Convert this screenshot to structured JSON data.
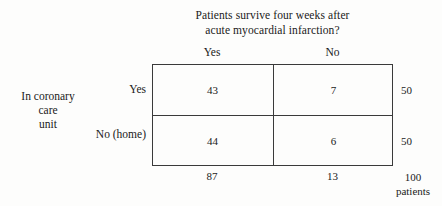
{
  "chart_data": {
    "type": "table",
    "title": "Patients survive four weeks after acute myocardial infarction?",
    "column_group_label_lines": [
      "Patients survive four weeks after",
      "acute myocardial infarction?"
    ],
    "row_group_label_lines": [
      "In coronary",
      "care",
      "unit"
    ],
    "row_group_label": "In coronary care unit",
    "columns": [
      "Yes",
      "No"
    ],
    "rows": [
      "Yes",
      "No (home)"
    ],
    "values": [
      [
        43,
        7
      ],
      [
        44,
        6
      ]
    ],
    "row_totals": [
      50,
      50
    ],
    "column_totals": [
      87,
      13
    ],
    "grand_total": 100,
    "grand_total_unit": "patients",
    "cells": [
      {
        "row": "Yes",
        "column": "Yes",
        "value": "43"
      },
      {
        "row": "Yes",
        "column": "No",
        "value": "7"
      },
      {
        "row": "No (home)",
        "column": "Yes",
        "value": "44"
      },
      {
        "row": "No (home)",
        "column": "No",
        "value": "6"
      }
    ],
    "row_total_labels": [
      "50",
      "50"
    ],
    "column_total_labels": [
      "87",
      "13"
    ],
    "grand_total_label": "100",
    "colors": {
      "background": "#fdfdfc",
      "rule": "#3a3a3a",
      "text": "#1a1a1a"
    }
  }
}
